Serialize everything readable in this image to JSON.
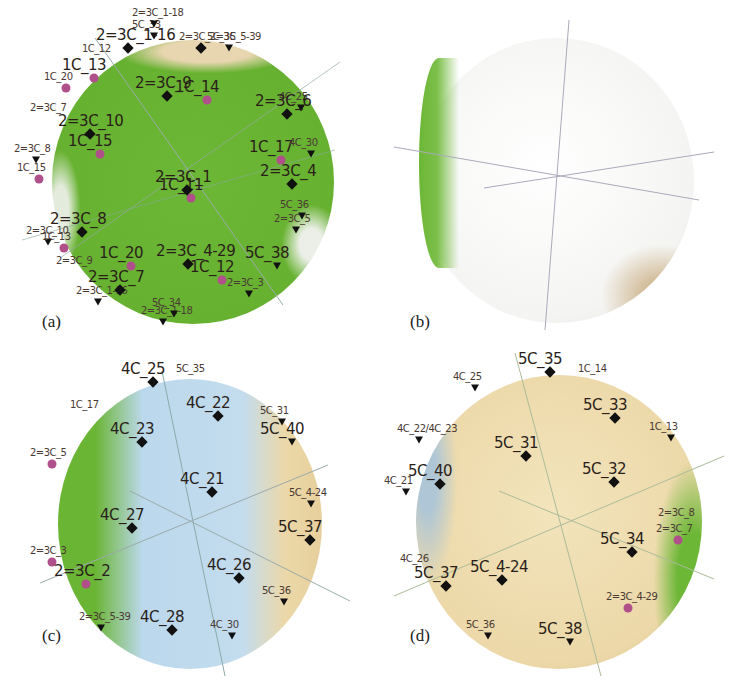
{
  "colors": {
    "green": "#6bb534",
    "white": "#f2f2f0",
    "blue": "#bcd8ec",
    "tan": "#ecd8a8",
    "marker": "#111111",
    "pink_marker": "#b0508a"
  },
  "panels": [
    {
      "caption": "(a)",
      "dominant_region": "green",
      "labels": [
        {
          "text": "5C_33",
          "x": 148,
          "y": 32,
          "size": "small",
          "marker": "tri"
        },
        {
          "text": "5C_35",
          "x": 223,
          "y": 44,
          "size": "small",
          "marker": "tri"
        },
        {
          "text": "1C_13",
          "x": 84,
          "y": 74,
          "size": "big",
          "marker": "pink"
        },
        {
          "text": "1C_14",
          "x": 197,
          "y": 96,
          "size": "big",
          "marker": "pink"
        },
        {
          "text": "4C_25",
          "x": 295,
          "y": 104,
          "size": "small",
          "marker": "tri"
        },
        {
          "text": "2=3C_7",
          "x": 46,
          "y": 115,
          "size": "small",
          "marker": "none"
        },
        {
          "text": "1C_15",
          "x": 90,
          "y": 150,
          "size": "big",
          "marker": "pink"
        },
        {
          "text": "2=3C_8",
          "x": 30,
          "y": 156,
          "size": "small",
          "marker": "tri"
        },
        {
          "text": "1C_17",
          "x": 271,
          "y": 156,
          "size": "big",
          "marker": "pink"
        },
        {
          "text": "1C_11",
          "x": 181,
          "y": 194,
          "size": "big",
          "marker": "pink"
        },
        {
          "text": "2=3C_5",
          "x": 290,
          "y": 226,
          "size": "small",
          "marker": "tri"
        },
        {
          "text": "2=3C_10",
          "x": 42,
          "y": 238,
          "size": "small",
          "marker": "tri"
        },
        {
          "text": "2=3C_9",
          "x": 72,
          "y": 268,
          "size": "small",
          "marker": "none"
        },
        {
          "text": "1C_20",
          "x": 121,
          "y": 262,
          "size": "big",
          "marker": "pink"
        },
        {
          "text": "1C_12",
          "x": 212,
          "y": 276,
          "size": "big",
          "marker": "pink"
        },
        {
          "text": "2=3C_3",
          "x": 243,
          "y": 290,
          "size": "small",
          "marker": "tri"
        },
        {
          "text": "2=3C_1-16",
          "x": 92,
          "y": 298,
          "size": "small",
          "marker": "tri"
        },
        {
          "text": "2=3C_1-18",
          "x": 157,
          "y": 318,
          "size": "small",
          "marker": "tri"
        }
      ]
    },
    {
      "caption": "(b)",
      "dominant_region": "white",
      "labels": [
        {
          "text": "2=3C_1-18",
          "x": 148,
          "y": 20,
          "size": "small",
          "marker": "tri"
        },
        {
          "text": "2=3C_1-16",
          "x": 118,
          "y": 44,
          "size": "big",
          "marker": "diamond"
        },
        {
          "text": "2=3C_2=3C_5-39",
          "x": 195,
          "y": 44,
          "size": "small",
          "marker": "diamond"
        },
        {
          "text": "1C_12",
          "x": 98,
          "y": 56,
          "size": "small",
          "marker": "none"
        },
        {
          "text": "1C_20",
          "x": 60,
          "y": 84,
          "size": "small",
          "marker": "pink"
        },
        {
          "text": "2=3C_9",
          "x": 157,
          "y": 92,
          "size": "big",
          "marker": "diamond"
        },
        {
          "text": "2=3C_6",
          "x": 277,
          "y": 110,
          "size": "big",
          "marker": "diamond"
        },
        {
          "text": "2=3C_10",
          "x": 80,
          "y": 130,
          "size": "big",
          "marker": "diamond"
        },
        {
          "text": "4C_30",
          "x": 305,
          "y": 150,
          "size": "small",
          "marker": "tri"
        },
        {
          "text": "1C_15",
          "x": 33,
          "y": 175,
          "size": "small",
          "marker": "pink"
        },
        {
          "text": "2=3C_4",
          "x": 282,
          "y": 180,
          "size": "big",
          "marker": "diamond"
        },
        {
          "text": "2=3C_1",
          "x": 177,
          "y": 186,
          "size": "big",
          "marker": "diamond"
        },
        {
          "text": "5C_36",
          "x": 296,
          "y": 212,
          "size": "small",
          "marker": "tri"
        },
        {
          "text": "2=3C_8",
          "x": 72,
          "y": 228,
          "size": "big",
          "marker": "diamond"
        },
        {
          "text": "1C_13",
          "x": 58,
          "y": 244,
          "size": "small",
          "marker": "pink"
        },
        {
          "text": "2=3C_4-29",
          "x": 178,
          "y": 260,
          "size": "big",
          "marker": "diamond"
        },
        {
          "text": "5C_38",
          "x": 267,
          "y": 262,
          "size": "big",
          "marker": "tri"
        },
        {
          "text": "2=3C_7",
          "x": 110,
          "y": 286,
          "size": "big",
          "marker": "diamond"
        },
        {
          "text": "5C_34",
          "x": 168,
          "y": 310,
          "size": "small",
          "marker": "tri"
        }
      ]
    },
    {
      "caption": "(c)",
      "dominant_region": "blue",
      "labels": [
        {
          "text": "4C_25",
          "x": 143,
          "y": 378,
          "size": "big",
          "marker": "diamond"
        },
        {
          "text": "5C_35",
          "x": 192,
          "y": 376,
          "size": "small",
          "marker": "none"
        },
        {
          "text": "4C_22",
          "x": 208,
          "y": 412,
          "size": "big",
          "marker": "diamond"
        },
        {
          "text": "1C_17",
          "x": 86,
          "y": 412,
          "size": "small",
          "marker": "none"
        },
        {
          "text": "5C_31",
          "x": 276,
          "y": 418,
          "size": "small",
          "marker": "tri"
        },
        {
          "text": "4C_23",
          "x": 132,
          "y": 438,
          "size": "big",
          "marker": "diamond"
        },
        {
          "text": "5C_40",
          "x": 282,
          "y": 438,
          "size": "big",
          "marker": "tri"
        },
        {
          "text": "2=3C_5",
          "x": 46,
          "y": 460,
          "size": "small",
          "marker": "pink"
        },
        {
          "text": "4C_21",
          "x": 202,
          "y": 488,
          "size": "big",
          "marker": "diamond"
        },
        {
          "text": "5C_4-24",
          "x": 305,
          "y": 500,
          "size": "small",
          "marker": "tri"
        },
        {
          "text": "4C_27",
          "x": 122,
          "y": 524,
          "size": "big",
          "marker": "diamond"
        },
        {
          "text": "5C_37",
          "x": 300,
          "y": 536,
          "size": "big",
          "marker": "diamond"
        },
        {
          "text": "2=3C_3",
          "x": 46,
          "y": 558,
          "size": "small",
          "marker": "pink"
        },
        {
          "text": "4C_26",
          "x": 229,
          "y": 574,
          "size": "big",
          "marker": "diamond"
        },
        {
          "text": "2=3C_2",
          "x": 76,
          "y": 580,
          "size": "big",
          "marker": "pink"
        },
        {
          "text": "5C_36",
          "x": 278,
          "y": 598,
          "size": "small",
          "marker": "tri"
        },
        {
          "text": "2=3C_5-39",
          "x": 95,
          "y": 624,
          "size": "small",
          "marker": "tri"
        },
        {
          "text": "4C_28",
          "x": 162,
          "y": 626,
          "size": "big",
          "marker": "diamond"
        },
        {
          "text": "4C_30",
          "x": 226,
          "y": 632,
          "size": "small",
          "marker": "tri"
        }
      ]
    },
    {
      "caption": "(d)",
      "dominant_region": "tan",
      "labels": [
        {
          "text": "5C_35",
          "x": 540,
          "y": 368,
          "size": "big",
          "marker": "diamond"
        },
        {
          "text": "1C_14",
          "x": 594,
          "y": 376,
          "size": "small",
          "marker": "none"
        },
        {
          "text": "4C_25",
          "x": 469,
          "y": 384,
          "size": "small",
          "marker": "tri"
        },
        {
          "text": "5C_33",
          "x": 605,
          "y": 414,
          "size": "big",
          "marker": "diamond"
        },
        {
          "text": "4C_22/4C_23",
          "x": 413,
          "y": 436,
          "size": "small",
          "marker": "tri"
        },
        {
          "text": "1C_13",
          "x": 665,
          "y": 434,
          "size": "small",
          "marker": "tri"
        },
        {
          "text": "5C_31",
          "x": 516,
          "y": 452,
          "size": "big",
          "marker": "diamond"
        },
        {
          "text": "5C_40",
          "x": 430,
          "y": 480,
          "size": "big",
          "marker": "diamond"
        },
        {
          "text": "5C_32",
          "x": 604,
          "y": 478,
          "size": "big",
          "marker": "diamond"
        },
        {
          "text": "4C_21",
          "x": 400,
          "y": 488,
          "size": "small",
          "marker": "tri"
        },
        {
          "text": "2=3C_8",
          "x": 674,
          "y": 520,
          "size": "small",
          "marker": "none"
        },
        {
          "text": "2=3C_7",
          "x": 672,
          "y": 536,
          "size": "small",
          "marker": "pink"
        },
        {
          "text": "4C_26",
          "x": 416,
          "y": 566,
          "size": "small",
          "marker": "none"
        },
        {
          "text": "5C_34",
          "x": 622,
          "y": 548,
          "size": "big",
          "marker": "diamond"
        },
        {
          "text": "5C_37",
          "x": 436,
          "y": 582,
          "size": "big",
          "marker": "diamond"
        },
        {
          "text": "5C_4-24",
          "x": 492,
          "y": 576,
          "size": "big",
          "marker": "diamond"
        },
        {
          "text": "2=3C_4-29",
          "x": 622,
          "y": 604,
          "size": "small",
          "marker": "pink"
        },
        {
          "text": "5C_36",
          "x": 482,
          "y": 632,
          "size": "small",
          "marker": "tri"
        },
        {
          "text": "5C_38",
          "x": 560,
          "y": 638,
          "size": "big",
          "marker": "tri"
        }
      ]
    }
  ]
}
